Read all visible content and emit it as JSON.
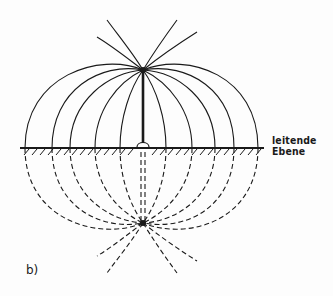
{
  "diagram": {
    "type": "electric-field-lines-image-charge",
    "plane_label_line1": "leitende",
    "plane_label_line2": "Ebene",
    "panel_label": "b)",
    "colors": {
      "ink": "#1a1a1a",
      "background": "#fdfdfd"
    },
    "elements": {
      "real_charge": {
        "x": 143,
        "y": 70
      },
      "image_charge": {
        "x": 143,
        "y": 223
      },
      "conducting_plane_y": 148,
      "field_line_ground_crossings_x": [
        25,
        52,
        70,
        95,
        120,
        166,
        192,
        215,
        234,
        258
      ]
    }
  }
}
